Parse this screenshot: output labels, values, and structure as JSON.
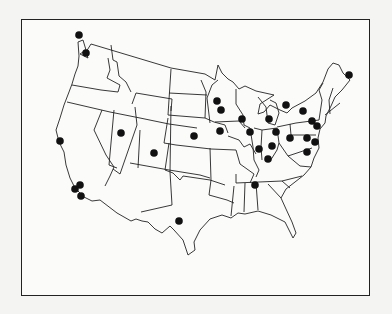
{
  "figure": {
    "type": "map",
    "title": "",
    "marker_color": "#111111",
    "border_color": "#222222",
    "markers": [
      {
        "id": 1,
        "region": "Washington (NW coast)",
        "x": 79,
        "y": 35
      },
      {
        "id": 2,
        "region": "Washington (Seattle area)",
        "x": 86,
        "y": 53
      },
      {
        "id": 3,
        "region": "California (Bay Area)",
        "x": 60,
        "y": 141
      },
      {
        "id": 4,
        "region": "California (Los Angeles)",
        "x": 80,
        "y": 185
      },
      {
        "id": 5,
        "region": "California (Los Angeles)",
        "x": 75,
        "y": 189
      },
      {
        "id": 6,
        "region": "California (San Diego)",
        "x": 81,
        "y": 196
      },
      {
        "id": 7,
        "region": "Utah",
        "x": 121,
        "y": 133
      },
      {
        "id": 8,
        "region": "Colorado",
        "x": 154,
        "y": 153
      },
      {
        "id": 9,
        "region": "Nebraska",
        "x": 194,
        "y": 136
      },
      {
        "id": 10,
        "region": "New Mexico / Texas",
        "x": 179,
        "y": 221
      },
      {
        "id": 11,
        "region": "Minnesota",
        "x": 217,
        "y": 101
      },
      {
        "id": 12,
        "region": "Minnesota",
        "x": 221,
        "y": 110
      },
      {
        "id": 13,
        "region": "Iowa",
        "x": 220,
        "y": 131
      },
      {
        "id": 14,
        "region": "Wisconsin",
        "x": 242,
        "y": 119
      },
      {
        "id": 15,
        "region": "Illinois",
        "x": 250,
        "y": 132
      },
      {
        "id": 16,
        "region": "Michigan",
        "x": 269,
        "y": 119
      },
      {
        "id": 17,
        "region": "Ontario/Michigan",
        "x": 286,
        "y": 105
      },
      {
        "id": 18,
        "region": "Ohio",
        "x": 276,
        "y": 132
      },
      {
        "id": 19,
        "region": "Indiana",
        "x": 259,
        "y": 149
      },
      {
        "id": 20,
        "region": "Indiana/Ohio",
        "x": 272,
        "y": 146
      },
      {
        "id": 21,
        "region": "Kentucky",
        "x": 268,
        "y": 159
      },
      {
        "id": 22,
        "region": "Pennsylvania",
        "x": 290,
        "y": 138
      },
      {
        "id": 23,
        "region": "New York",
        "x": 303,
        "y": 111
      },
      {
        "id": 24,
        "region": "New York City",
        "x": 312,
        "y": 121
      },
      {
        "id": 25,
        "region": "New Jersey",
        "x": 317,
        "y": 126
      },
      {
        "id": 26,
        "region": "Pennsylvania (east)",
        "x": 307,
        "y": 138
      },
      {
        "id": 27,
        "region": "Delaware/Maryland",
        "x": 315,
        "y": 142
      },
      {
        "id": 28,
        "region": "Virginia",
        "x": 307,
        "y": 152
      },
      {
        "id": 29,
        "region": "Tennessee",
        "x": 255,
        "y": 185
      },
      {
        "id": 30,
        "region": "Maine",
        "x": 349,
        "y": 75
      }
    ]
  }
}
